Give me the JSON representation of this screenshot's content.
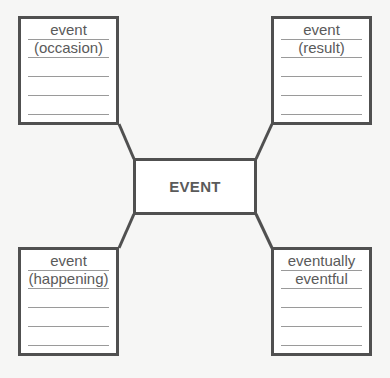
{
  "center": {
    "label": "EVENT"
  },
  "boxes": {
    "top_left": {
      "line1": "event",
      "line2": "(occasion)"
    },
    "top_right": {
      "line1": "event",
      "line2": "(result)"
    },
    "bottom_left": {
      "line1": "event",
      "line2": "(happening)"
    },
    "bottom_right": {
      "line1": "eventually",
      "line2": "eventful"
    }
  },
  "colors": {
    "stroke": "#505050",
    "rule": "#9a9a9a",
    "text": "#5a5a5a",
    "background": "#f6f6f5"
  }
}
